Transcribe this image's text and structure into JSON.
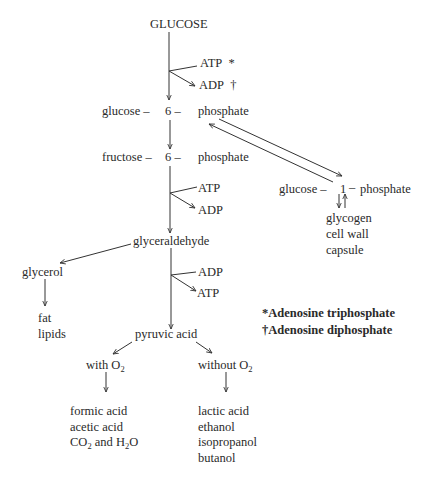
{
  "title": "GLUCOSE",
  "step1": {
    "in": "ATP",
    "in_mark": "*",
    "out": "ADP",
    "out_mark": "†"
  },
  "g6p": {
    "a": "glucose –",
    "b": "6 –",
    "c": "phosphate"
  },
  "f6p": {
    "a": "fructose –",
    "b": "6 –",
    "c": "phosphate"
  },
  "step2": {
    "in": "ATP",
    "out": "ADP"
  },
  "g1p": {
    "a": "glucose –",
    "b": "1",
    "c": "–",
    "d": "phosphate"
  },
  "polymers": [
    "glycogen",
    "cell wall",
    "capsule"
  ],
  "glyceraldehyde": "glyceraldehyde",
  "glycerol": "glycerol",
  "glycerol_products": [
    "fat",
    "lipids"
  ],
  "step3": {
    "in": "ADP",
    "out": "ATP"
  },
  "legend": {
    "atp": "*Adenosine triphosphate",
    "adp": "†Adenosine diphosphate"
  },
  "pyruvic": "pyruvic acid",
  "aerobic": {
    "label": "with O",
    "sub": "2",
    "products": [
      "formic acid",
      "acetic acid"
    ],
    "co2": {
      "a": "CO",
      "sub1": "2",
      "b": " and H",
      "sub2": "2",
      "c": "O"
    }
  },
  "anaerobic": {
    "label": "without O",
    "sub": "2",
    "products": [
      "lactic acid",
      "ethanol",
      "isopropanol",
      "butanol"
    ]
  }
}
